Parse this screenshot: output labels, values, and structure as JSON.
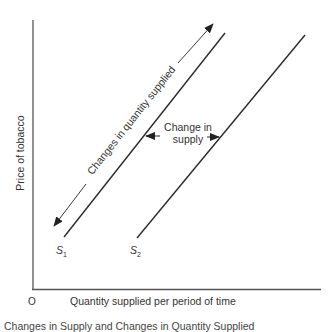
{
  "diagram": {
    "y_axis_label": "Price of tobacco",
    "x_axis_label": "Quantity supplied per period of time",
    "origin_label": "O",
    "curves": [
      {
        "name": "S",
        "subscript": "1",
        "x1": 64,
        "y1": 237,
        "x2": 225,
        "y2": 33
      },
      {
        "name": "S",
        "subscript": "2",
        "x1": 137,
        "y1": 238,
        "x2": 305,
        "y2": 35
      }
    ],
    "annotations": {
      "quantity_change": "Changes in quantity supplied",
      "supply_change_line1": "Change in",
      "supply_change_line2": "supply"
    },
    "caption": "Changes in Supply and Changes in Quantity Supplied",
    "colors": {
      "line": "#2a2a2a",
      "axis": "#555555"
    }
  }
}
